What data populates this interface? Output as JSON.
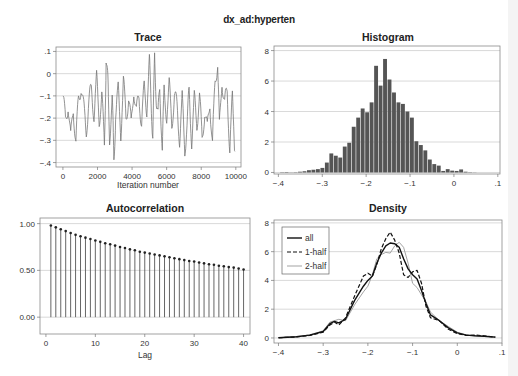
{
  "figure": {
    "title": "dx_ad:hyperten",
    "panels": {
      "trace": {
        "title": "Trace",
        "xlabel": "Iteration number"
      },
      "histogram": {
        "title": "Histogram"
      },
      "autocorrelation": {
        "title": "Autocorrelation",
        "xlabel": "Lag"
      },
      "density": {
        "title": "Density"
      }
    }
  },
  "chart_data": [
    {
      "type": "line",
      "title": "Trace",
      "xlabel": "Iteration number",
      "ylabel": "",
      "xlim": [
        0,
        10000
      ],
      "ylim": [
        -0.42,
        0.12
      ],
      "xticks": [
        0,
        2000,
        4000,
        6000,
        8000,
        10000
      ],
      "xtick_labels": [
        "0",
        "2000",
        "4000",
        "6000",
        "8000",
        "10000"
      ],
      "yticks": [
        0.1,
        0,
        -0.1,
        -0.2,
        -0.3,
        -0.4
      ],
      "ytick_labels": [
        ".1",
        "0",
        "-.1",
        "-.2",
        "-.3",
        "-.4"
      ],
      "grid": true,
      "color": "#777777",
      "x": [
        0,
        150,
        300,
        450,
        600,
        750,
        900,
        1050,
        1200,
        1350,
        1500,
        1650,
        1800,
        1950,
        2100,
        2250,
        2400,
        2500,
        2600,
        2700,
        2850,
        2950,
        3050,
        3200,
        3350,
        3500,
        3650,
        3800,
        3950,
        4100,
        4250,
        4400,
        4550,
        4700,
        4850,
        5000,
        5100,
        5200,
        5300,
        5400,
        5500,
        5600,
        5750,
        5850,
        6000,
        6150,
        6300,
        6450,
        6600,
        6750,
        6900,
        7050,
        7200,
        7300,
        7450,
        7600,
        7750,
        7900,
        8050,
        8200,
        8350,
        8500,
        8650,
        8800,
        8950,
        9050,
        9200,
        9350,
        9500,
        9650,
        9800,
        9950
      ],
      "y": [
        -0.1,
        -0.22,
        -0.13,
        -0.3,
        -0.15,
        -0.31,
        -0.12,
        -0.05,
        -0.16,
        -0.25,
        -0.13,
        -0.07,
        -0.18,
        -0.03,
        -0.2,
        -0.1,
        -0.33,
        0.08,
        -0.05,
        -0.28,
        -0.12,
        -0.39,
        -0.18,
        -0.08,
        -0.26,
        -0.04,
        -0.2,
        -0.1,
        -0.24,
        -0.06,
        -0.18,
        -0.1,
        -0.22,
        -0.07,
        -0.15,
        0.05,
        -0.12,
        -0.28,
        0.06,
        -0.1,
        -0.2,
        -0.05,
        -0.34,
        -0.08,
        -0.18,
        -0.06,
        -0.22,
        -0.1,
        -0.15,
        -0.29,
        -0.12,
        -0.34,
        -0.2,
        -0.08,
        -0.3,
        -0.12,
        -0.22,
        -0.1,
        -0.3,
        -0.16,
        -0.26,
        -0.12,
        -0.32,
        -0.04,
        0.06,
        -0.25,
        -0.02,
        -0.14,
        -0.08,
        -0.33,
        -0.12,
        -0.35
      ]
    },
    {
      "type": "bar",
      "title": "Histogram",
      "xlim": [
        -0.4,
        0.1
      ],
      "ylim": [
        0,
        8.3
      ],
      "xticks": [
        -0.4,
        -0.3,
        -0.2,
        -0.1,
        0,
        0.1
      ],
      "xtick_labels": [
        "-.4",
        "-.3",
        "-.2",
        "-.1",
        "0",
        ".1"
      ],
      "yticks": [
        0,
        2,
        4,
        6,
        8
      ],
      "ytick_labels": [
        "0",
        "2",
        "4",
        "6",
        "8"
      ],
      "grid": true,
      "color": "#555555",
      "bin_start": -0.396,
      "bin_width": 0.0102,
      "values": [
        0.02,
        0.03,
        0.01,
        0.02,
        0.05,
        0.08,
        0.15,
        0.18,
        0.22,
        0.3,
        0.65,
        1.25,
        1.1,
        0.98,
        1.7,
        1.95,
        3.0,
        3.6,
        4.2,
        3.95,
        4.6,
        7.0,
        5.7,
        7.45,
        6.1,
        5.25,
        4.6,
        4.5,
        4.0,
        3.6,
        2.05,
        1.8,
        1.45,
        0.85,
        0.55,
        0.45,
        0.1,
        0.22,
        0.12,
        0.1,
        0.2,
        0.05,
        0.02,
        0.01
      ]
    },
    {
      "type": "bar",
      "subtype": "stem",
      "title": "Autocorrelation",
      "xlabel": "Lag",
      "xlim": [
        -1,
        41
      ],
      "ylim": [
        -0.18,
        1.06
      ],
      "xticks": [
        0,
        10,
        20,
        30,
        40
      ],
      "xtick_labels": [
        "0",
        "10",
        "20",
        "30",
        "40"
      ],
      "yticks": [
        1.0,
        0.5,
        0.0
      ],
      "ytick_labels": [
        "1.00",
        "0.50",
        "0.00"
      ],
      "grid": true,
      "color": "#555555",
      "categories": [
        1,
        2,
        3,
        4,
        5,
        6,
        7,
        8,
        9,
        10,
        11,
        12,
        13,
        14,
        15,
        16,
        17,
        18,
        19,
        20,
        21,
        22,
        23,
        24,
        25,
        26,
        27,
        28,
        29,
        30,
        31,
        32,
        33,
        34,
        35,
        36,
        37,
        38,
        39,
        40
      ],
      "values": [
        0.98,
        0.96,
        0.94,
        0.92,
        0.9,
        0.88,
        0.865,
        0.85,
        0.835,
        0.82,
        0.805,
        0.79,
        0.78,
        0.765,
        0.75,
        0.74,
        0.725,
        0.715,
        0.7,
        0.69,
        0.68,
        0.67,
        0.66,
        0.65,
        0.64,
        0.63,
        0.62,
        0.61,
        0.6,
        0.595,
        0.585,
        0.575,
        0.565,
        0.56,
        0.55,
        0.545,
        0.535,
        0.53,
        0.52,
        0.51
      ]
    },
    {
      "type": "line",
      "title": "Density",
      "xlim": [
        -0.41,
        0.1
      ],
      "ylim": [
        -0.35,
        8.2
      ],
      "xticks": [
        -0.4,
        -0.3,
        -0.2,
        -0.1,
        0,
        0.1
      ],
      "xtick_labels": [
        "-.4",
        "-.3",
        "-.2",
        "-.1",
        "0",
        ".1"
      ],
      "yticks": [
        0,
        2,
        4,
        6,
        8
      ],
      "ytick_labels": [
        "0",
        "2",
        "4",
        "6",
        "8"
      ],
      "grid": true,
      "legend": {
        "position": "top-left",
        "entries": [
          "all",
          "1-half",
          "2-half"
        ]
      },
      "x": [
        -0.4,
        -0.36,
        -0.33,
        -0.3,
        -0.285,
        -0.275,
        -0.265,
        -0.25,
        -0.23,
        -0.21,
        -0.2,
        -0.19,
        -0.18,
        -0.17,
        -0.16,
        -0.15,
        -0.14,
        -0.13,
        -0.12,
        -0.11,
        -0.1,
        -0.09,
        -0.08,
        -0.07,
        -0.06,
        -0.04,
        -0.02,
        0.0,
        0.02,
        0.04,
        0.06,
        0.085
      ],
      "series": [
        {
          "name": "all",
          "style": "solid",
          "color": "#111111",
          "values": [
            0.02,
            0.08,
            0.2,
            0.45,
            1.0,
            1.15,
            1.05,
            1.3,
            2.6,
            3.6,
            4.0,
            4.3,
            5.2,
            5.9,
            6.4,
            6.6,
            6.55,
            6.3,
            5.5,
            4.8,
            4.4,
            4.1,
            3.3,
            2.4,
            1.6,
            1.2,
            0.7,
            0.35,
            0.2,
            0.15,
            0.12,
            0.06
          ]
        },
        {
          "name": "1-half",
          "style": "dashed",
          "color": "#111111",
          "values": [
            0.02,
            0.07,
            0.18,
            0.4,
            0.9,
            1.1,
            0.9,
            1.4,
            2.9,
            4.3,
            4.5,
            4.3,
            5.1,
            6.2,
            6.9,
            7.35,
            6.8,
            5.9,
            4.4,
            4.2,
            4.6,
            4.7,
            3.8,
            2.2,
            1.4,
            1.2,
            0.6,
            0.3,
            0.18,
            0.2,
            0.15,
            0.05
          ]
        },
        {
          "name": "2-half",
          "style": "solid-thin",
          "color": "#999999",
          "values": [
            0.02,
            0.09,
            0.22,
            0.5,
            1.1,
            1.2,
            1.3,
            1.2,
            2.3,
            3.2,
            3.6,
            4.4,
            5.5,
            5.8,
            5.95,
            5.9,
            6.4,
            6.65,
            6.3,
            5.2,
            3.8,
            3.5,
            3.0,
            2.5,
            1.8,
            1.2,
            0.8,
            0.4,
            0.22,
            0.14,
            0.1,
            0.06
          ]
        }
      ]
    }
  ]
}
